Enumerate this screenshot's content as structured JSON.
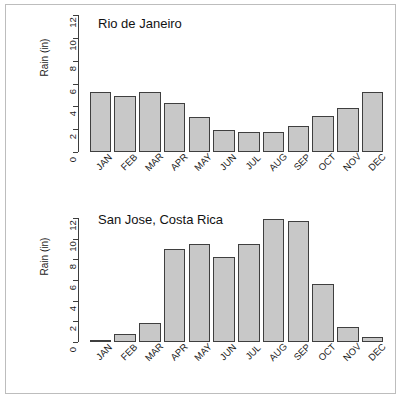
{
  "figure": {
    "background_color": "#ffffff",
    "frame_color": "#bdbdbd",
    "bar_fill_color": "#c8c8c8",
    "bar_border_color": "#3f3f3f",
    "axis_color": "#3d3d3d"
  },
  "chart_data": [
    {
      "type": "bar",
      "title": "Rio de Janeiro",
      "xlabel": "",
      "ylabel": "Rain (in)",
      "categories": [
        "JAN",
        "FEB",
        "MAR",
        "APR",
        "MAY",
        "JUN",
        "JUL",
        "AUG",
        "SEP",
        "OCT",
        "NOV",
        "DEC"
      ],
      "values": [
        5.3,
        4.9,
        5.3,
        4.25,
        3.1,
        1.95,
        1.75,
        1.75,
        2.3,
        3.15,
        3.85,
        5.3
      ],
      "ylim": [
        0,
        12
      ],
      "yticks": [
        0,
        2,
        4,
        6,
        8,
        10,
        12
      ],
      "grid": false,
      "legend": "none"
    },
    {
      "type": "bar",
      "title": "San Jose, Costa Rica",
      "xlabel": "",
      "ylabel": "Rain (in)",
      "categories": [
        "JAN",
        "FEB",
        "MAR",
        "APR",
        "MAY",
        "JUN",
        "JUL",
        "AUG",
        "SEP",
        "OCT",
        "NOV",
        "DEC"
      ],
      "values": [
        0.15,
        0.75,
        1.8,
        9.0,
        9.5,
        8.25,
        9.5,
        11.9,
        11.7,
        5.6,
        1.5,
        0.5
      ],
      "ylim": [
        0,
        12
      ],
      "yticks": [
        0,
        2,
        4,
        6,
        8,
        10,
        12
      ],
      "grid": false,
      "legend": "none"
    }
  ]
}
